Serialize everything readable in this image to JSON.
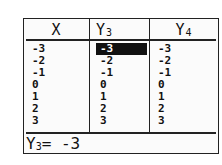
{
  "table": {
    "headers": [
      {
        "name": "X",
        "sub": ""
      },
      {
        "name": "Y",
        "sub": "3"
      },
      {
        "name": "Y",
        "sub": "4"
      }
    ],
    "columns": {
      "x": [
        "-3",
        "-2",
        "-1",
        "0",
        "1",
        "2",
        "3"
      ],
      "y3": [
        "-3",
        "-2",
        "-1",
        "0",
        "1",
        "2",
        "3"
      ],
      "y4": [
        "-3",
        "-2",
        "-1",
        "0",
        "1",
        "2",
        "3"
      ]
    },
    "selected": {
      "column": "y3",
      "row": 0
    }
  },
  "status": {
    "var": "Y",
    "sub": "3",
    "expr": "= -3"
  },
  "colors": {
    "foreground": "#111111",
    "background": "#fbfbfb",
    "highlight": "#111111"
  }
}
